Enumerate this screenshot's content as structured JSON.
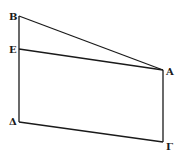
{
  "diagram": {
    "background": "#ffffff",
    "stroke_color": "#1a1a1a",
    "points": {
      "B": {
        "label": "B",
        "x": 19,
        "y": 16
      },
      "E": {
        "label": "E",
        "x": 19,
        "y": 49
      },
      "A": {
        "label": "A",
        "x": 163,
        "y": 70
      },
      "Delta": {
        "label": "Δ",
        "x": 19,
        "y": 122
      },
      "Gamma": {
        "label": "Γ",
        "x": 163,
        "y": 142
      }
    },
    "segments": [
      [
        "B",
        "A"
      ],
      [
        "E",
        "A"
      ],
      [
        "B",
        "Delta"
      ],
      [
        "Delta",
        "Gamma"
      ],
      [
        "A",
        "Gamma"
      ]
    ]
  }
}
